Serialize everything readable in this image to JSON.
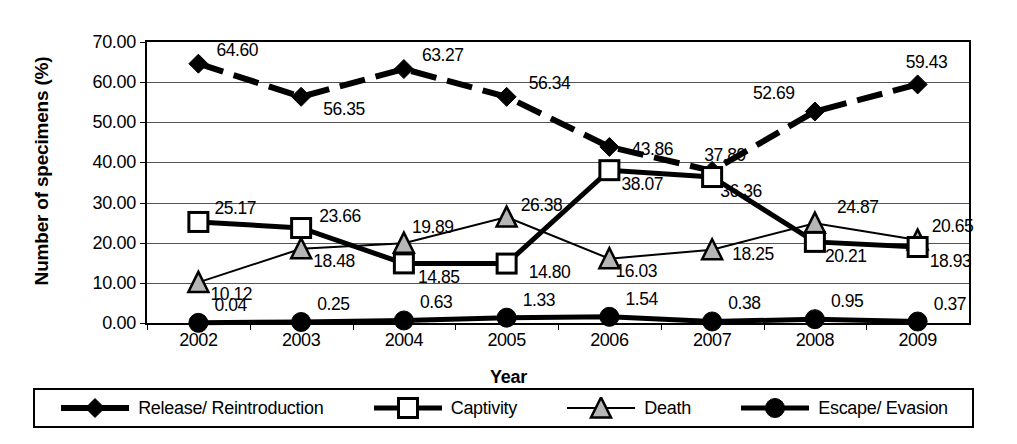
{
  "chart_data": {
    "type": "line",
    "title": "",
    "xlabel": "Year",
    "ylabel": "Number of specimens (%)",
    "categories": [
      "2002",
      "2003",
      "2004",
      "2005",
      "2006",
      "2007",
      "2008",
      "2009"
    ],
    "ylim": [
      0,
      70
    ],
    "ytick_labels": [
      "0.00",
      "10.00",
      "20.00",
      "30.00",
      "40.00",
      "50.00",
      "60.00",
      "70.00"
    ],
    "ytick_values": [
      0,
      10,
      20,
      30,
      40,
      50,
      60,
      70
    ],
    "grid": true,
    "legend_position": "bottom",
    "series": [
      {
        "name": "Release/ Reintroduction",
        "marker": "diamond",
        "line_style": "dashed",
        "color": "#000000",
        "values": [
          64.6,
          56.35,
          63.27,
          56.34,
          43.86,
          37.89,
          52.69,
          59.43
        ],
        "labels": [
          "64.60",
          "56.35",
          "63.27",
          "56.34",
          "43.86",
          "37.89",
          "52.69",
          "59.43"
        ]
      },
      {
        "name": "Captivity",
        "marker": "square-open",
        "line_style": "solid-thick",
        "color": "#000000",
        "values": [
          25.17,
          23.66,
          14.85,
          14.8,
          38.07,
          36.36,
          20.21,
          18.93
        ],
        "labels": [
          "25.17",
          "23.66",
          "14.85",
          "14.80",
          "38.07",
          "36.36",
          "20.21",
          "18.93"
        ]
      },
      {
        "name": "Death",
        "marker": "triangle-grey",
        "line_style": "solid-thin",
        "color": "#000000",
        "values": [
          10.12,
          18.48,
          19.89,
          26.38,
          16.03,
          18.25,
          24.87,
          20.65
        ],
        "labels": [
          "10.12",
          "18.48",
          "19.89",
          "26.38",
          "16.03",
          "18.25",
          "24.87",
          "20.65"
        ]
      },
      {
        "name": "Escape/ Evasion",
        "marker": "circle-filled",
        "line_style": "solid-thick",
        "color": "#000000",
        "values": [
          0.04,
          0.25,
          0.63,
          1.33,
          1.54,
          0.38,
          0.95,
          0.37
        ],
        "labels": [
          "0.04",
          "0.25",
          "0.63",
          "1.33",
          "1.54",
          "0.38",
          "0.95",
          "0.37"
        ]
      }
    ]
  }
}
